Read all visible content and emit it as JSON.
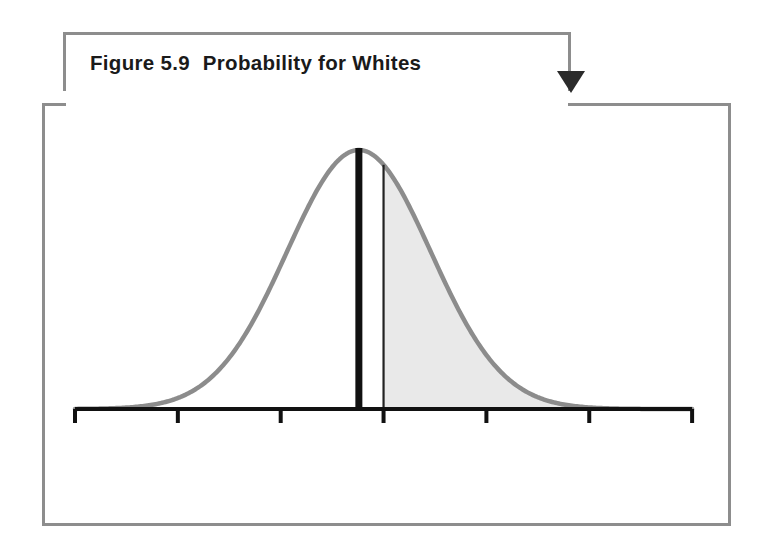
{
  "figure": {
    "number_label": "Figure 5.9",
    "title": "Probability for Whites",
    "arrow_icon": "down-triangle-arrow"
  },
  "chart_data": {
    "type": "area",
    "title": "Probability for Whites",
    "xlabel": "Years of Education",
    "ylabel": "",
    "xlim": [
      0,
      30
    ],
    "xticks": [
      0,
      5,
      10,
      15,
      20,
      25,
      30
    ],
    "xtick_labels": [
      "0",
      "5",
      "10",
      "15",
      "20",
      "25",
      "30"
    ],
    "grid": false,
    "legend": null,
    "distribution": {
      "kind": "normal",
      "mean": 13.8,
      "std_dev": 3.5,
      "curve_color": "#8c8c8c"
    },
    "markers": [
      {
        "name": "mean-line",
        "x": 13.8,
        "style": "thick-vertical-black-line",
        "color": "#111111"
      },
      {
        "name": "threshold-line",
        "x": 15,
        "style": "thin-vertical-black-line",
        "color": "#222222"
      }
    ],
    "shaded_region": {
      "from": 15,
      "to": 30,
      "fill_color": "#e9e9e9",
      "probability": 0.3228,
      "label": "0.3228"
    },
    "annotations": [
      {
        "text": "0.3228",
        "x": 19.1,
        "y_frac": 0.42
      }
    ]
  },
  "axis": {
    "tick_labels": [
      "0",
      "5",
      "10",
      "15",
      "20",
      "25",
      "30"
    ],
    "axis_title": "Years of Education"
  },
  "colors": {
    "frame_border": "#8d8d8d",
    "curve": "#8c8c8c",
    "fill": "#e9e9e9",
    "axis": "#111111",
    "text": "#111111",
    "background": "#ffffff"
  }
}
